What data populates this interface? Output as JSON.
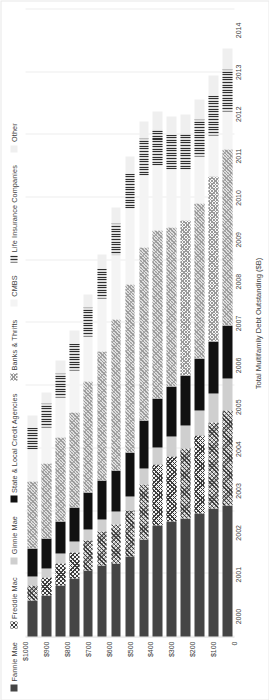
{
  "chart_data": {
    "type": "bar",
    "subtype": "stacked-horizontal",
    "title": "",
    "xlabel": "",
    "ylabel": "Total Multifamily Debt Outstanding ($B)",
    "categories": [
      "2000",
      "2001",
      "2002",
      "2003",
      "2004",
      "2005",
      "2006",
      "2007",
      "2008",
      "2009",
      "2010",
      "2011",
      "2012",
      "2013",
      "2014"
    ],
    "ylim": [
      0,
      1000
    ],
    "yticks": [
      "0",
      "$100",
      "$200",
      "$300",
      "$400",
      "$500",
      "$600",
      "$700",
      "$800",
      "$900",
      "$1000"
    ],
    "ytick_values": [
      0,
      100,
      200,
      300,
      400,
      500,
      600,
      700,
      800,
      900,
      1000
    ],
    "grid": true,
    "legend_position": "top",
    "series": [
      {
        "name": "Fannie Mae",
        "pattern": "p-fannie",
        "color": "#454545",
        "values": [
          58,
          66,
          82,
          93,
          105,
          113,
          117,
          127,
          155,
          177,
          184,
          188,
          196,
          204,
          209
        ]
      },
      {
        "name": "Freddie Mac",
        "pattern": "p-freddie",
        "color": "#f2f2f2",
        "values": [
          24,
          28,
          35,
          41,
          48,
          55,
          62,
          74,
          88,
          97,
          103,
          112,
          124,
          138,
          152
        ]
      },
      {
        "name": "Ginnie Mae",
        "pattern": "p-ginnie",
        "color": "#cfcfcf",
        "values": [
          14,
          15,
          16,
          17,
          18,
          19,
          20,
          22,
          25,
          28,
          32,
          36,
          41,
          46,
          51
        ]
      },
      {
        "name": "State & Local Credit Agencies",
        "pattern": "p-state",
        "color": "#111111",
        "values": [
          44,
          47,
          51,
          55,
          59,
          62,
          66,
          71,
          76,
          78,
          80,
          81,
          82,
          83,
          84
        ]
      },
      {
        "name": "Banks & Thrifts",
        "pattern": "p-banks",
        "color": "#fafafa",
        "values": [
          107,
          120,
          134,
          152,
          177,
          206,
          240,
          268,
          276,
          268,
          254,
          246,
          248,
          262,
          281
        ]
      },
      {
        "name": "CMBS",
        "pattern": "p-cmbs",
        "color": "#f4f4f4",
        "values": [
          52,
          58,
          63,
          67,
          72,
          84,
          102,
          120,
          116,
          104,
          92,
          82,
          74,
          66,
          60
        ]
      },
      {
        "name": "Life Insurance Companies",
        "pattern": "p-life",
        "color": "#dcdcdc",
        "values": [
          35,
          37,
          39,
          42,
          45,
          48,
          52,
          56,
          58,
          57,
          56,
          57,
          60,
          64,
          68
        ]
      },
      {
        "name": "Other",
        "pattern": "p-other",
        "color": "#efefef",
        "values": [
          18,
          19,
          20,
          21,
          22,
          23,
          25,
          27,
          28,
          28,
          29,
          30,
          31,
          32,
          33
        ]
      }
    ],
    "totals": [
      352,
      390,
      440,
      488,
      546,
      610,
      684,
      765,
      822,
      837,
      830,
      832,
      856,
      895,
      938
    ]
  },
  "axis": {
    "y_title": "Total Multifamily Debt Outstanding ($B)"
  }
}
